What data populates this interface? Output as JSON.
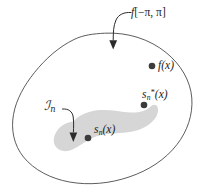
{
  "figure": {
    "type": "math-set-diagram",
    "background_color": "#ffffff",
    "outline_color": "#4a4a4a",
    "inner_region_color": "#d6d6d6",
    "point_color": "#3b3b3b",
    "arrow_color": "#2b2b2b"
  },
  "labels": {
    "domain": {
      "function": "f",
      "interval_open": "[",
      "interval": "−π, π",
      "interval_close": "]",
      "full": "f[−π, π]"
    },
    "subspace": {
      "symbol": "ℐ",
      "subscript": "n",
      "full": "ℐn"
    },
    "point_f": {
      "base": "f",
      "arg": "(x)",
      "full": "f(x)"
    },
    "point_sn_star": {
      "base": "s",
      "subscript": "n",
      "superscript": "*",
      "arg": "(x)",
      "full": "sn*(x)"
    },
    "point_sn": {
      "base": "s",
      "subscript": "n",
      "arg": "(x)",
      "full": "sn(x)"
    }
  },
  "points": [
    {
      "name": "f(x)",
      "x": 152,
      "y": 66,
      "inside_subspace": false
    },
    {
      "name": "sn*(x)",
      "x": 144,
      "y": 105,
      "inside_subspace": false
    },
    {
      "name": "sn(x)",
      "x": 88,
      "y": 138,
      "inside_subspace": true
    }
  ],
  "annotations": [
    {
      "name": "domain-arrow",
      "from_label": "f[−π, π]",
      "points_to": "outer-boundary"
    },
    {
      "name": "subspace-arrow",
      "from_label": "ℐn",
      "points_to": "inner-region"
    }
  ]
}
